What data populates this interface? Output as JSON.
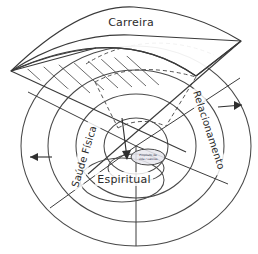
{
  "diagram": {
    "type": "concentric-wheel",
    "background_color": "#ffffff",
    "line_color": "#4a4a4a",
    "sectors": [
      {
        "id": "carreira",
        "label": "Carreira",
        "position": "top",
        "raised": true
      },
      {
        "id": "relacionamento",
        "label": "Relacionamento",
        "position": "right",
        "raised": false
      },
      {
        "id": "saude-fisica",
        "label": "Saúde Física",
        "position": "left",
        "raised": false
      },
      {
        "id": "espiritual",
        "label": "Espiritual",
        "position": "bottom",
        "raised": false
      }
    ],
    "core": {
      "label_line_1": "Propósito de",
      "label_line_2": "vida / valores",
      "fill_color": "#e8e8ee"
    },
    "arrows": [
      {
        "id": "arrow-left",
        "direction": "left",
        "sector": "saude-fisica"
      },
      {
        "id": "arrow-right",
        "direction": "right",
        "sector": "relacionamento"
      },
      {
        "id": "arrow-down",
        "direction": "down",
        "sector": "carreira"
      }
    ],
    "rings": {
      "count": 4,
      "radii": [
        23,
        45,
        72,
        100
      ]
    },
    "annotations": {
      "dashed_arc_note": "projection of raised wedge onto base plane",
      "hatch_note": "lift hatching under raised Carreira wedge"
    }
  }
}
